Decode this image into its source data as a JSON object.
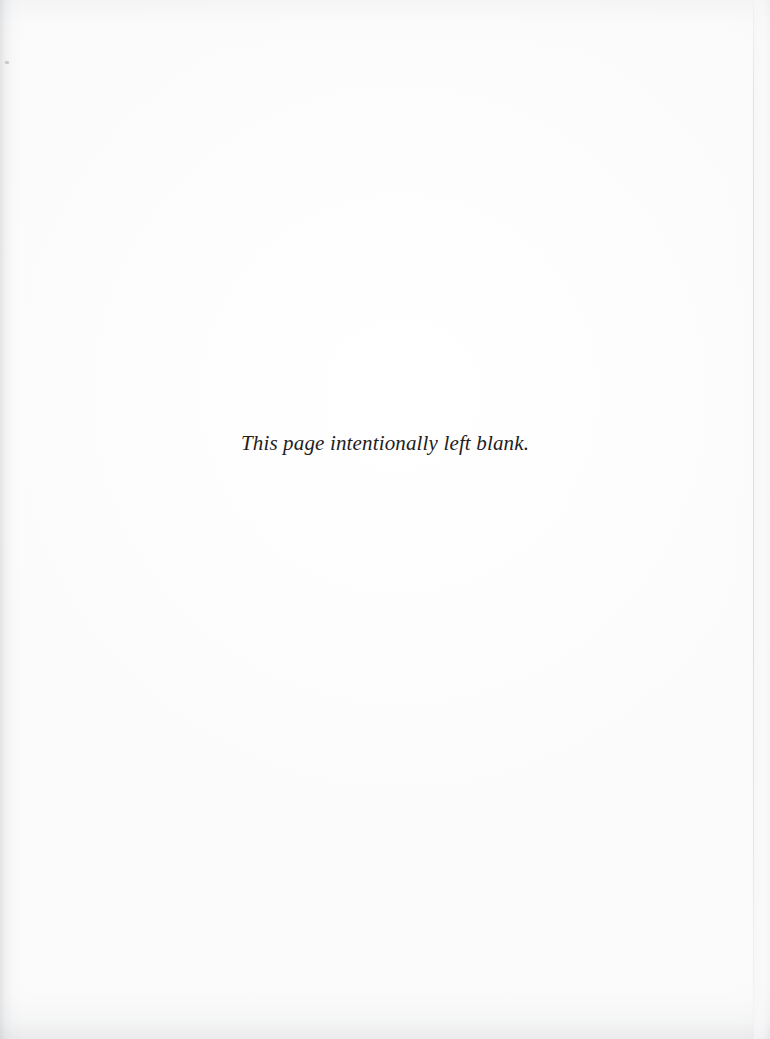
{
  "page": {
    "kind": "scanned-book-page",
    "notice_text": "This page intentionally left blank.",
    "background_color": "#fdfdfd",
    "ink_color": "#1e1d1c",
    "edge_line_color": "#c6c8cd",
    "shadow_color": "#aaacb0",
    "width_px": "770",
    "height_px": "1039"
  },
  "artifacts": {
    "dust_speck_label": "dust-speck",
    "left_gutter_label": "left-gutter-shadow",
    "bottom_edge_label": "bottom-edge-shadow",
    "top_edge_label": "top-edge-shadow",
    "right_edge_label": "right-edge-shadow",
    "page_edge_line_label": "page-edge-line"
  }
}
